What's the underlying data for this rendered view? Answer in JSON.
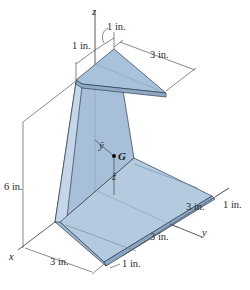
{
  "figure": {
    "axes": {
      "x": "x",
      "y": "y",
      "z": "z"
    },
    "centroid": {
      "label": "G",
      "ybar": "ȳ",
      "zbar": "z̄"
    },
    "dimensions": {
      "top_offset_1": "1 in.",
      "top_offset_2": "1 in.",
      "top_length": "3 in.",
      "height": "6 in.",
      "right_1": "1 in.",
      "right_3a": "3 in.",
      "right_3b": "3 in.",
      "bottom_1": "1 in.",
      "bottom_3": "3 in."
    },
    "colors": {
      "plate_light": "#b9cde3",
      "plate_mid": "#9db7d3",
      "plate_dark": "#8aa6c4",
      "edge": "#2f3e4e",
      "dimension_line": "#3a3a3a"
    }
  }
}
